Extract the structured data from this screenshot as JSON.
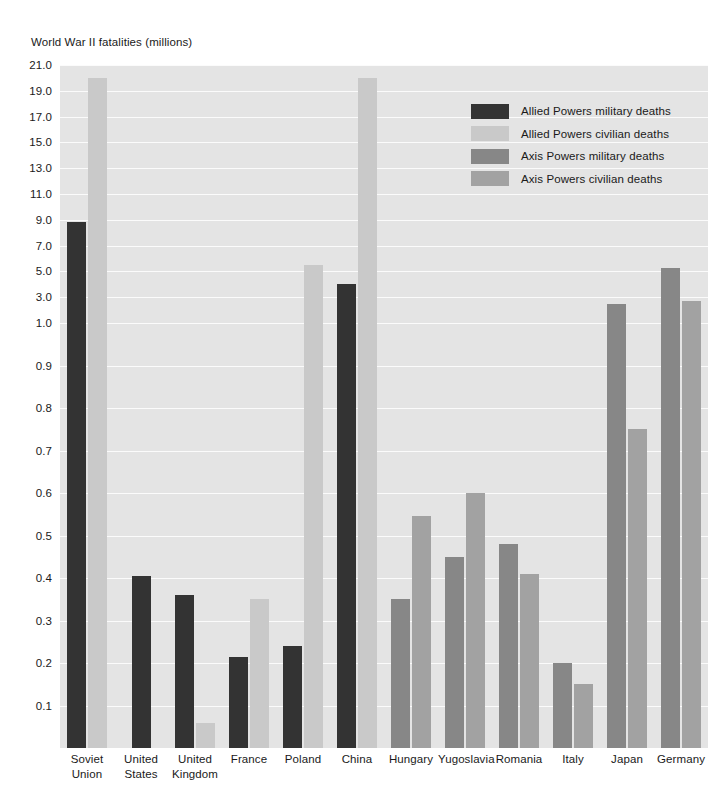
{
  "chart_data": {
    "type": "bar",
    "title": "World War II fatalities (millions)",
    "xlabel": "",
    "ylabel": "",
    "grid": true,
    "legend_position": "inside-top-right",
    "y_axis_note": "piecewise scale: 0.1-1.0 lower segment, then 1.0-21.0 in steps of 2.0",
    "y_ticks": [
      "21.0",
      "19.0",
      "17.0",
      "15.0",
      "13.0",
      "11.0",
      "9.0",
      "7.0",
      "5.0",
      "3.0",
      "1.0",
      "0.9",
      "0.8",
      "0.7",
      "0.6",
      "0.5",
      "0.4",
      "0.3",
      "0.2",
      "0.1"
    ],
    "y_tick_values": [
      21.0,
      19.0,
      17.0,
      15.0,
      13.0,
      11.0,
      9.0,
      7.0,
      5.0,
      3.0,
      1.0,
      0.9,
      0.8,
      0.7,
      0.6,
      0.5,
      0.4,
      0.3,
      0.2,
      0.1
    ],
    "categories": [
      "Soviet Union",
      "United States",
      "United Kingdom",
      "France",
      "Poland",
      "China",
      "Hungary",
      "Yugoslavia",
      "Romania",
      "Italy",
      "Japan",
      "Germany"
    ],
    "category_lines": [
      [
        "Soviet",
        "Union"
      ],
      [
        "United",
        "States"
      ],
      [
        "United",
        "Kingdom"
      ],
      [
        "France"
      ],
      [
        "Poland"
      ],
      [
        "China"
      ],
      [
        "Hungary"
      ],
      [
        "Yugoslavia"
      ],
      [
        "Romania"
      ],
      [
        "Italy"
      ],
      [
        "Japan"
      ],
      [
        "Germany"
      ]
    ],
    "series": [
      {
        "name": "Allied Powers military deaths",
        "color": "#333333",
        "values": [
          8.8,
          0.405,
          0.36,
          0.215,
          0.24,
          4.0,
          null,
          null,
          null,
          null,
          null,
          null
        ]
      },
      {
        "name": "Allied Powers civilian deaths",
        "color": "#c9c9c9",
        "values": [
          20.0,
          null,
          0.06,
          0.35,
          5.5,
          20.0,
          null,
          null,
          null,
          null,
          null,
          null
        ]
      },
      {
        "name": "Axis Powers military deaths",
        "color": "#878787",
        "values": [
          null,
          null,
          null,
          null,
          null,
          null,
          0.35,
          0.45,
          0.48,
          0.2,
          2.5,
          5.3
        ]
      },
      {
        "name": "Axis Powers civilian deaths",
        "color": "#a2a2a2",
        "values": [
          null,
          null,
          null,
          null,
          null,
          null,
          0.545,
          0.6,
          0.41,
          0.15,
          0.75,
          2.7
        ]
      }
    ],
    "colors": {
      "plot_background": "#e4e4e4",
      "gridline": "#fbfbfb",
      "page_background": "#ffffff",
      "text": "#1a1a1a"
    }
  },
  "legend": {
    "items": [
      {
        "label": "Allied Powers military deaths",
        "color": "#333333"
      },
      {
        "label": "Allied Powers civilian deaths",
        "color": "#c9c9c9"
      },
      {
        "label": "Axis Powers military deaths",
        "color": "#878787"
      },
      {
        "label": "Axis Powers civilian deaths",
        "color": "#a2a2a2"
      }
    ]
  }
}
